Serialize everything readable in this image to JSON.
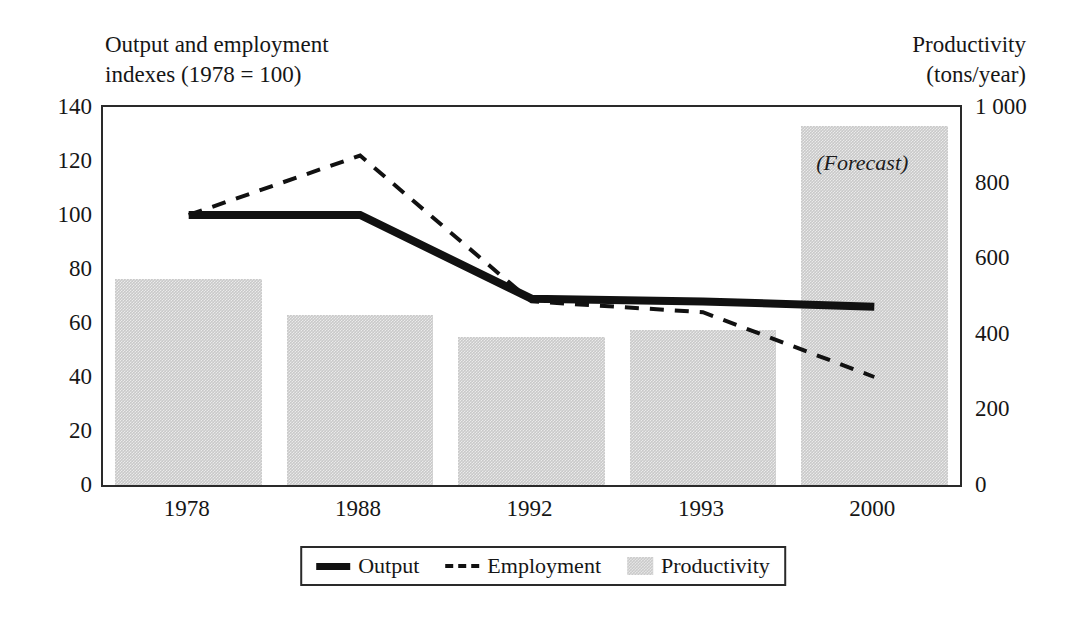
{
  "chart_data": {
    "type": "bar",
    "title": "",
    "categories": [
      "1978",
      "1988",
      "1992",
      "1993",
      "2000"
    ],
    "left_axis": {
      "label": "Output and employment indexes (1978 = 100)",
      "label_line1": "Output and employment",
      "label_line2": "indexes (1978 = 100)",
      "ticks": [
        "140",
        "120",
        "100",
        "80",
        "60",
        "40",
        "20",
        "0"
      ],
      "tick_values": [
        140,
        120,
        100,
        80,
        60,
        40,
        20,
        0
      ],
      "ylim": [
        0,
        140
      ]
    },
    "right_axis": {
      "label": "Productivity (tons/year)",
      "label_line1": "Productivity",
      "label_line2": "(tons/year)",
      "ticks": [
        "1 000",
        "800",
        "600",
        "400",
        "200",
        "0"
      ],
      "tick_values": [
        1000,
        800,
        600,
        400,
        200,
        0
      ],
      "ylim": [
        0,
        1000
      ]
    },
    "series": [
      {
        "name": "Output",
        "kind": "line",
        "style": "solid",
        "axis": "left",
        "color": "#111111",
        "values": [
          100,
          100,
          69,
          68,
          66
        ]
      },
      {
        "name": "Employment",
        "kind": "line",
        "style": "dashed",
        "axis": "left",
        "color": "#111111",
        "values": [
          100,
          122,
          68,
          64,
          40
        ]
      },
      {
        "name": "Productivity",
        "kind": "bar",
        "axis": "right",
        "color": "#c9c9c9",
        "values": [
          545,
          450,
          392,
          410,
          950
        ]
      }
    ],
    "annotations": [
      {
        "text": "(Forecast)",
        "category": "2000",
        "style": "italic"
      }
    ],
    "legend": {
      "position": "bottom",
      "entries": [
        {
          "label": "Output",
          "marker": "solid-line"
        },
        {
          "label": "Employment",
          "marker": "dashed-line"
        },
        {
          "label": "Productivity",
          "marker": "filled-square"
        }
      ]
    },
    "grid": false
  }
}
